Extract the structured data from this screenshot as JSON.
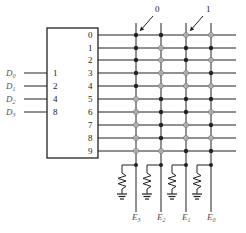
{
  "diagram": {
    "title": "",
    "encoder_box": {
      "inputs": [
        {
          "signal": "D",
          "sub": "0",
          "weight": "1"
        },
        {
          "signal": "D",
          "sub": "1",
          "weight": "2"
        },
        {
          "signal": "D",
          "sub": "2",
          "weight": "4"
        },
        {
          "signal": "D",
          "sub": "3",
          "weight": "8"
        }
      ],
      "outputs": [
        "0",
        "1",
        "2",
        "3",
        "4",
        "5",
        "6",
        "7",
        "8",
        "9"
      ]
    },
    "legend": {
      "filled_label": "0",
      "hollow_label": "1"
    },
    "columns": [
      {
        "signal": "E",
        "sub": "3"
      },
      {
        "signal": "E",
        "sub": "2"
      },
      {
        "signal": "E",
        "sub": "1"
      },
      {
        "signal": "E",
        "sub": "0"
      }
    ],
    "matrix": [
      [
        "filled",
        "filled",
        "hollow",
        "hollow"
      ],
      [
        "filled",
        "hollow",
        "filled",
        "filled"
      ],
      [
        "filled",
        "hollow",
        "filled",
        "hollow"
      ],
      [
        "filled",
        "hollow",
        "hollow",
        "filled"
      ],
      [
        "filled",
        "hollow",
        "hollow",
        "hollow"
      ],
      [
        "hollow",
        "filled",
        "filled",
        "filled"
      ],
      [
        "hollow",
        "filled",
        "filled",
        "hollow"
      ],
      [
        "hollow",
        "filled",
        "hollow",
        "filled"
      ],
      [
        "hollow",
        "filled",
        "hollow",
        "hollow"
      ],
      [
        "hollow",
        "hollow",
        "filled",
        "filled"
      ]
    ],
    "colors": {
      "line": "#222222",
      "hollow_stroke": "#777777",
      "label_gray": "#555555"
    }
  }
}
